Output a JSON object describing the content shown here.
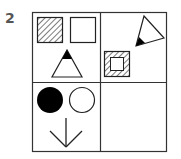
{
  "puzzle": {
    "number": "2",
    "grid": {
      "rows": 2,
      "cols": 2,
      "cells": [
        {
          "position": "top-left",
          "contents": [
            "hatched-square",
            "empty-square",
            "triangle-with-black-tip-up"
          ]
        },
        {
          "position": "top-right",
          "contents": [
            "triangle-with-black-tip-rotated",
            "hatched-frame-square"
          ]
        },
        {
          "position": "bottom-left",
          "contents": [
            "filled-circle",
            "empty-circle",
            "down-arrow"
          ]
        },
        {
          "position": "bottom-right",
          "contents": []
        }
      ]
    },
    "colors": {
      "stroke": "#222222",
      "fill": "#000000",
      "number": "#555555"
    }
  }
}
